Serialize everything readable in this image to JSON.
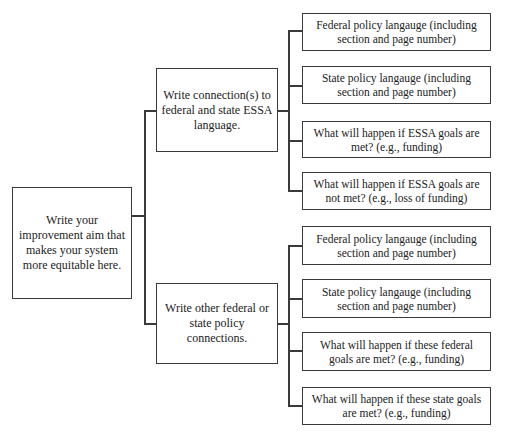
{
  "diagram": {
    "type": "tree",
    "root": {
      "label": "Write your improvement aim that makes your system more equitable here."
    },
    "branches": [
      {
        "label": "Write connection(s) to federal and state ESSA language.",
        "children": [
          "Federal policy langauge (including section and page number)",
          "State policy langauge (including section and page number)",
          "What will happen if ESSA goals are met? (e.g., funding)",
          "What will happen if ESSA goals are not met? (e.g., loss of funding)"
        ]
      },
      {
        "label": "Write other federal or state policy connections.",
        "children": [
          "Federal policy langauge (including section and page number)",
          "State policy langauge (including section and page number)",
          "What will happen if these federal goals are met? (e.g., funding)",
          "What will happen if these state goals are met? (e.g., funding)"
        ]
      }
    ],
    "colors": {
      "line": "#3a3a3a",
      "background": "#ffffff",
      "text": "#222222"
    }
  }
}
